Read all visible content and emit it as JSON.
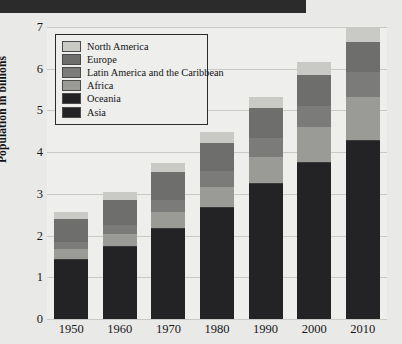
{
  "banner": {
    "visible": true,
    "color": "#2b2b2b"
  },
  "chart_data": {
    "type": "bar",
    "stacked": true,
    "title": "",
    "xlabel": "",
    "ylabel": "Population in billions",
    "categories": [
      "1950",
      "1960",
      "1970",
      "1980",
      "1990",
      "2000",
      "2010"
    ],
    "ylim": [
      0,
      7
    ],
    "yticks": [
      0,
      1,
      2,
      3,
      4,
      5,
      6,
      7
    ],
    "grid": true,
    "legend_position": "upper-left",
    "series": [
      {
        "name": "Asia",
        "color": "#232326",
        "values": [
          1.4,
          1.7,
          2.15,
          2.65,
          3.2,
          3.72,
          4.22
        ]
      },
      {
        "name": "Oceania",
        "color": "#232326",
        "values": [
          0.013,
          0.016,
          0.02,
          0.023,
          0.027,
          0.031,
          0.037
        ]
      },
      {
        "name": "Africa",
        "color": "#9a9a97",
        "values": [
          0.23,
          0.29,
          0.37,
          0.48,
          0.64,
          0.82,
          1.04
        ]
      },
      {
        "name": "Latin America and the Caribbean",
        "color": "#7b7b79",
        "values": [
          0.17,
          0.22,
          0.29,
          0.36,
          0.44,
          0.52,
          0.59
        ]
      },
      {
        "name": "Europe",
        "color": "#6e6e6c",
        "values": [
          0.55,
          0.6,
          0.66,
          0.69,
          0.72,
          0.73,
          0.74
        ]
      },
      {
        "name": "North America",
        "color": "#c9c9c6",
        "values": [
          0.17,
          0.2,
          0.23,
          0.25,
          0.28,
          0.31,
          0.34
        ]
      }
    ],
    "totals": [
      2.44,
      3.03,
      3.7,
      4.45,
      5.31,
      6.12,
      6.92
    ]
  },
  "legend": {
    "items": [
      {
        "label": "North America",
        "color": "#c9c9c6"
      },
      {
        "label": "Europe",
        "color": "#6e6e6c"
      },
      {
        "label": "Latin America and the Caribbean",
        "color": "#7b7b79"
      },
      {
        "label": "Africa",
        "color": "#9a9a97"
      },
      {
        "label": "Oceania",
        "color": "#232326"
      },
      {
        "label": "Asia",
        "color": "#232326"
      }
    ]
  }
}
